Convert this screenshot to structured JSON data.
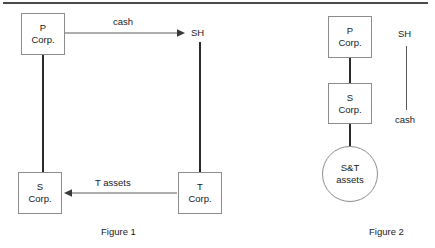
{
  "figures": [
    {
      "caption": "Figure 1",
      "nodes": [
        {
          "id": "p-corp",
          "line1": "P",
          "line2": "Corp.",
          "shape": "box"
        },
        {
          "id": "s-corp",
          "line1": "S",
          "line2": "Corp.",
          "shape": "box"
        },
        {
          "id": "t-corp",
          "line1": "T",
          "line2": "Corp.",
          "shape": "box"
        },
        {
          "id": "sh",
          "line1": "SH",
          "line2": "",
          "shape": "text"
        }
      ],
      "flows": [
        {
          "id": "cash-flow",
          "label": "cash",
          "from": "p-corp",
          "to": "sh",
          "direction": "right"
        },
        {
          "id": "t-assets-flow",
          "label": "T assets",
          "from": "t-corp",
          "to": "s-corp",
          "direction": "left"
        }
      ]
    },
    {
      "caption": "Figure 2",
      "nodes": [
        {
          "id": "p-corp-2",
          "line1": "P",
          "line2": "Corp.",
          "shape": "box"
        },
        {
          "id": "s-corp-2",
          "line1": "S",
          "line2": "Corp.",
          "shape": "box"
        },
        {
          "id": "st-assets",
          "line1": "S&T",
          "line2": "assets",
          "shape": "circle"
        },
        {
          "id": "sh-2",
          "line1": "SH",
          "line2": "",
          "shape": "text"
        }
      ],
      "flows": [
        {
          "id": "cash-label-2",
          "label": "cash",
          "from": "sh-2",
          "to": "",
          "direction": "none"
        }
      ]
    }
  ],
  "figure1": {
    "p_corp": {
      "line1": "P",
      "line2": "Corp."
    },
    "s_corp": {
      "line1": "S",
      "line2": "Corp."
    },
    "t_corp": {
      "line1": "T",
      "line2": "Corp."
    },
    "sh_label": "SH",
    "cash_label": "cash",
    "t_assets_label": "T assets",
    "caption": "Figure 1"
  },
  "figure2": {
    "p_corp": {
      "line1": "P",
      "line2": "Corp."
    },
    "s_corp": {
      "line1": "S",
      "line2": "Corp."
    },
    "st_assets": {
      "line1": "S&T",
      "line2": "assets"
    },
    "sh_label": "SH",
    "cash_label": "cash",
    "caption": "Figure 2"
  },
  "colors": {
    "background": "#ffffff",
    "box_border": "#8c8c8c",
    "connector": "#2b2b2b",
    "arrow": "#5a5a5a",
    "text": "#1a1a1a",
    "rule": "#4a4a4a"
  }
}
